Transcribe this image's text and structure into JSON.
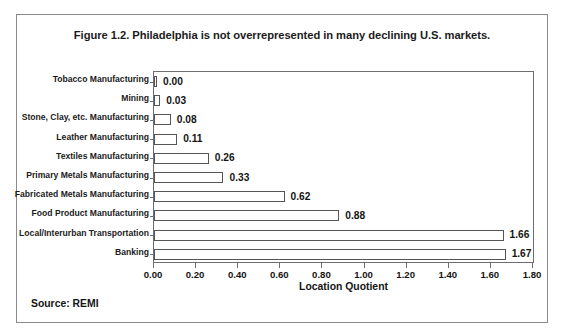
{
  "figure": {
    "title": "Figure 1.2. Philadelphia is not overrepresented in many declining U.S. markets.",
    "source_note": "Source: REMI"
  },
  "chart_data": {
    "type": "bar",
    "orientation": "horizontal",
    "title": "Figure 1.2. Philadelphia is not overrepresented in many declining U.S. markets.",
    "xlabel": "Location Quotient",
    "ylabel": "",
    "xlim": [
      0.0,
      1.8
    ],
    "xticks": [
      0.0,
      0.2,
      0.4,
      0.6,
      0.8,
      1.0,
      1.2,
      1.4,
      1.6,
      1.8
    ],
    "xtick_labels": [
      "0.00",
      "0.20",
      "0.40",
      "0.60",
      "0.80",
      "1.00",
      "1.20",
      "1.40",
      "1.60",
      "1.80"
    ],
    "grid": false,
    "legend": false,
    "bar_fill": "#ffffff",
    "bar_edge": "#555555",
    "categories": [
      "Tobacco Manufacturing",
      "Mining",
      "Stone, Clay, etc. Manufacturing",
      "Leather Manufacturing",
      "Textiles Manufacturing",
      "Primary Metals Manufacturing",
      "Fabricated Metals Manufacturing",
      "Food Product Manufacturing",
      "Local/Interurban Transportation",
      "Banking"
    ],
    "values": [
      0.0,
      0.03,
      0.08,
      0.11,
      0.26,
      0.33,
      0.62,
      0.88,
      1.66,
      1.67
    ],
    "value_labels": [
      "0.00",
      "0.03",
      "0.08",
      "0.11",
      "0.26",
      "0.33",
      "0.62",
      "0.88",
      "1.66",
      "1.67"
    ]
  }
}
